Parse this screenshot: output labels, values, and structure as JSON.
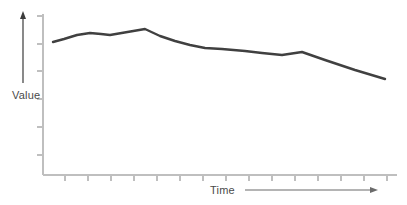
{
  "chart_data": {
    "type": "line",
    "title": "",
    "subtitle": "",
    "xlabel": "Time",
    "ylabel": "Value",
    "grid": false,
    "legend": null,
    "axis_style": "open-axes-with-direction-arrows",
    "xlim": [
      0,
      15
    ],
    "ylim": [
      0,
      10
    ],
    "x_tick_labels": [],
    "y_tick_labels": [],
    "x_tick_count": 15,
    "y_tick_count": 6,
    "annotations": [],
    "series": [
      {
        "name": "Value",
        "color": "#404040",
        "line_width": 2.4,
        "x": [
          0.0,
          0.8,
          1.7,
          2.6,
          3.3,
          4.0,
          4.7,
          5.6,
          6.5,
          7.4,
          8.3,
          9.2,
          10.1,
          11.0,
          11.9,
          12.8,
          13.7,
          14.6,
          15.4
        ],
        "values": [
          8.05,
          8.25,
          8.55,
          8.72,
          8.65,
          8.58,
          8.95,
          8.55,
          8.2,
          7.9,
          7.65,
          7.6,
          7.5,
          7.38,
          7.3,
          7.45,
          7.1,
          6.7,
          6.35
        ],
        "points_px": [
          [
            53,
            42
          ],
          [
            64,
            39
          ],
          [
            77,
            35
          ],
          [
            90,
            33
          ],
          [
            101,
            34
          ],
          [
            110,
            35
          ],
          [
            145,
            29
          ],
          [
            160,
            36
          ],
          [
            175,
            41
          ],
          [
            190,
            45
          ],
          [
            205,
            48
          ],
          [
            222,
            49
          ],
          [
            245,
            51
          ],
          [
            262,
            53
          ],
          [
            282,
            55
          ],
          [
            302,
            52
          ],
          [
            325,
            60
          ],
          [
            355,
            70
          ],
          [
            385,
            79
          ]
        ]
      }
    ]
  },
  "axes": {
    "y_axis": {
      "color": "#bfbfbf",
      "x_px": 43,
      "top_px": 14,
      "bottom_px": 175
    },
    "x_axis": {
      "color": "#bfbfbf",
      "y_px": 175,
      "left_px": 43,
      "right_px": 397
    },
    "tick_color": "#bfbfbf"
  },
  "direction_arrows": {
    "value_arrow": {
      "name": "value-direction-arrow",
      "color": "#3b3b3b",
      "x_px": 23,
      "top_px": 13,
      "bottom_px": 83
    },
    "time_arrow": {
      "name": "time-direction-arrow",
      "color": "#6b6b6b",
      "y_px": 190,
      "left_px": 245,
      "right_px": 377
    }
  }
}
